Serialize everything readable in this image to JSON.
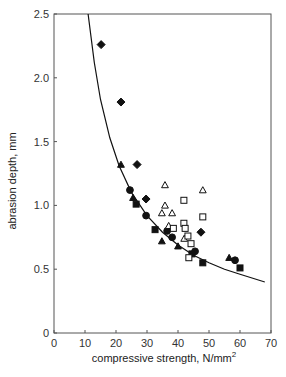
{
  "chart_data": {
    "type": "scatter",
    "title": "",
    "xlabel": "compressive strength, N/mm",
    "xlabel_superscript": "2",
    "ylabel": "abrasion depth, mm",
    "xlim": [
      0,
      70
    ],
    "ylim": [
      0,
      2.5
    ],
    "xticks": [
      0,
      10,
      20,
      30,
      40,
      50,
      60,
      70
    ],
    "yticks": [
      0,
      0.5,
      1.0,
      1.5,
      2.0,
      2.5
    ],
    "xtick_labels": [
      "0",
      "10",
      "20",
      "30",
      "40",
      "50",
      "60",
      "70"
    ],
    "ytick_labels": [
      "0",
      "0.5",
      "1.0",
      "1.5",
      "2.0",
      "2.5"
    ],
    "grid": false,
    "legend": null,
    "series": [
      {
        "name": "filled diamond",
        "marker": "diamond-filled",
        "points": [
          [
            15.2,
            2.26
          ],
          [
            21.6,
            1.81
          ],
          [
            26.8,
            1.32
          ],
          [
            29.7,
            1.05
          ],
          [
            47.4,
            0.79
          ]
        ]
      },
      {
        "name": "filled triangle",
        "marker": "triangle-filled",
        "points": [
          [
            21.6,
            1.32
          ],
          [
            25.5,
            1.06
          ],
          [
            34.8,
            0.72
          ],
          [
            40.0,
            0.68
          ],
          [
            56.5,
            0.59
          ]
        ]
      },
      {
        "name": "filled circle",
        "marker": "circle-filled",
        "points": [
          [
            24.5,
            1.12
          ],
          [
            29.7,
            0.92
          ],
          [
            38.1,
            0.75
          ],
          [
            45.5,
            0.64
          ],
          [
            58.4,
            0.57
          ],
          [
            36.5,
            0.8
          ]
        ]
      },
      {
        "name": "filled square",
        "marker": "square-filled",
        "points": [
          [
            26.5,
            1.01
          ],
          [
            32.6,
            0.81
          ],
          [
            48.0,
            0.55
          ],
          [
            60.0,
            0.51
          ],
          [
            44.5,
            0.62
          ]
        ]
      },
      {
        "name": "open triangle",
        "marker": "triangle-open",
        "points": [
          [
            35.8,
            1.16
          ],
          [
            35.8,
            1.0
          ],
          [
            34.8,
            0.94
          ],
          [
            38.1,
            0.94
          ],
          [
            48.0,
            1.12
          ],
          [
            37.0,
            0.84
          ],
          [
            42.0,
            0.74
          ]
        ]
      },
      {
        "name": "open square",
        "marker": "square-open",
        "points": [
          [
            41.9,
            1.04
          ],
          [
            48.0,
            0.91
          ],
          [
            41.9,
            0.86
          ],
          [
            42.3,
            0.82
          ],
          [
            43.2,
            0.76
          ],
          [
            44.2,
            0.7
          ],
          [
            43.5,
            0.59
          ],
          [
            38.5,
            0.82
          ]
        ]
      }
    ],
    "fit_curve": {
      "description": "hyperbolic fit, depth ≈ 27.5 / strength",
      "points": [
        [
          11.0,
          2.5
        ],
        [
          13,
          2.12
        ],
        [
          15,
          1.83
        ],
        [
          18,
          1.53
        ],
        [
          21,
          1.31
        ],
        [
          25,
          1.1
        ],
        [
          30,
          0.92
        ],
        [
          35,
          0.79
        ],
        [
          40,
          0.69
        ],
        [
          45,
          0.61
        ],
        [
          50,
          0.55
        ],
        [
          55,
          0.5
        ],
        [
          60,
          0.46
        ],
        [
          68,
          0.4
        ]
      ]
    }
  }
}
